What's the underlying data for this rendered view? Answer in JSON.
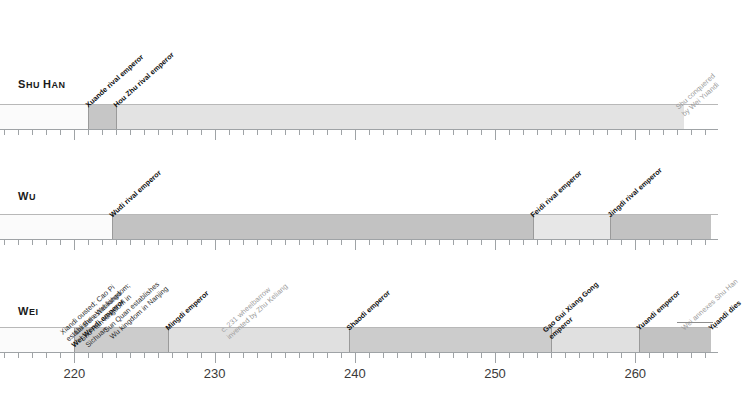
{
  "chart_data": {
    "type": "timeline",
    "xlabel": "",
    "ylabel": "",
    "xlim": [
      214.7,
      265.9
    ],
    "tick_labels": [
      "220",
      "230",
      "240",
      "250",
      "260"
    ],
    "tick_values": [
      220,
      230,
      240,
      250,
      260
    ],
    "minor_tick_step": 1,
    "grid": false,
    "legend": "none",
    "rows": [
      {
        "name": "Shu Han",
        "label": "Shu Han",
        "segments": [
          {
            "start": 214.7,
            "end": 221.0,
            "color": "#fbfbfb"
          },
          {
            "start": 221.0,
            "end": 223.0,
            "color": "#c6c6c6"
          },
          {
            "start": 223.0,
            "end": 263.5,
            "color": "#e3e3e3"
          }
        ],
        "events": [
          {
            "year": 221.0,
            "text": "Xuande rival emperor",
            "style": "bold"
          },
          {
            "year": 223.0,
            "text": "Hou Zhu rival emperor",
            "style": "bold"
          },
          {
            "year": 263.5,
            "text": "Shu conquered by Wei Yuandi",
            "style": "grey",
            "lines": [
              "Shu conquered",
              "by Wei Yuandi"
            ]
          }
        ]
      },
      {
        "name": "Wu",
        "label": "Wu",
        "segments": [
          {
            "start": 214.7,
            "end": 222.7,
            "color": "#fbfbfb"
          },
          {
            "start": 222.7,
            "end": 252.7,
            "color": "#c2c2c2"
          },
          {
            "start": 252.7,
            "end": 258.2,
            "color": "#e7e7e7"
          },
          {
            "start": 258.2,
            "end": 265.4,
            "color": "#c2c2c2"
          }
        ],
        "events": [
          {
            "year": 222.7,
            "text": "Wudi rival emperor",
            "style": "bold"
          },
          {
            "year": 252.7,
            "text": "Feidi rival emperor",
            "style": "bold"
          },
          {
            "year": 258.2,
            "text": "Jingdi rival emperor",
            "style": "bold"
          }
        ]
      },
      {
        "name": "Wei",
        "label": "Wei",
        "segments": [
          {
            "start": 214.7,
            "end": 220.0,
            "color": "#fbfbfb"
          },
          {
            "start": 220.0,
            "end": 226.7,
            "color": "#cccccc"
          },
          {
            "start": 226.7,
            "end": 239.6,
            "color": "#e0e0e0"
          },
          {
            "start": 239.6,
            "end": 254.0,
            "color": "#cccccc"
          },
          {
            "start": 254.0,
            "end": 260.3,
            "color": "#e0e0e0"
          },
          {
            "start": 260.3,
            "end": 265.4,
            "color": "#c2c2c2"
          }
        ],
        "events": [
          {
            "year": 220.0,
            "text": "Xiandi ousted; Cao Pi establishes Wei kingdom; Wei Wendi emperor",
            "style": "mixed",
            "lines": [
              "Xiandi ousted; Cao Pi",
              "establishes Wei kingdom;",
              "Wei Wendi emperor"
            ],
            "bold_line": 2
          },
          {
            "year": 221.0,
            "text": "Liu Bei establishes Shu Han kingdom in Sichuan",
            "style": "plain",
            "lines": [
              "Liu Bei establishes",
              "Shu Han kingdom in",
              "Sichuan"
            ]
          },
          {
            "year": 222.7,
            "text": "Sun Quan establishes Wu kingdom in Nanjing",
            "style": "plain",
            "lines": [
              "Sun Quan establishes",
              "Wu kingdom in Nanjing"
            ]
          },
          {
            "year": 226.7,
            "text": "Mingdi emperor",
            "style": "bold"
          },
          {
            "year": 231.0,
            "text": "c. 231 wheelbarrow invented by Zhu Keliang",
            "style": "grey",
            "lines": [
              "c. 231 wheelbarrow",
              "invented by Zhu Keliang"
            ]
          },
          {
            "year": 239.6,
            "text": "Shaodi emperor",
            "style": "bold"
          },
          {
            "year": 254.0,
            "text": "Gao Gui Xiang Gong emperor",
            "style": "bold",
            "lines": [
              "Gao Gui Xiang Gong",
              "emperor"
            ]
          },
          {
            "year": 260.3,
            "text": "Yuandi emperor",
            "style": "bold"
          },
          {
            "year": 263.5,
            "text": "Wei annexes Shu Han",
            "style": "grey"
          },
          {
            "year": 265.4,
            "text": "Yuandi dies",
            "style": "bold"
          }
        ]
      }
    ]
  },
  "colors": {
    "axis": "#9fa3a6",
    "tick_text": "#3a3a3a",
    "band_light": "#e3e3e3",
    "band_mid": "#cccccc",
    "band_dark": "#c2c2c2",
    "grey_text": "#9b9b9b",
    "dark_text": "#111111"
  }
}
